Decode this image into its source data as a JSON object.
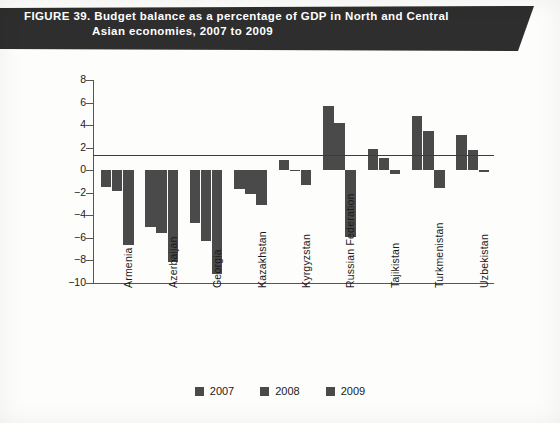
{
  "figure": {
    "banner_line1": "FIGURE 39. Budget balance as a percentage of GDP in North and Central",
    "banner_line2": "Asian economies, 2007 to 2009"
  },
  "legend": {
    "items": [
      {
        "label": "2007",
        "color": "#4a4a4a"
      },
      {
        "label": "2008",
        "color": "#4a4a4a"
      },
      {
        "label": "2009",
        "color": "#4a4a4a"
      }
    ]
  },
  "axis": {
    "y_title": "Percentage of GDP",
    "y_ticks": [
      "8",
      "6",
      "4",
      "2",
      "0",
      "-2",
      "-4",
      "-6",
      "-8",
      "-10"
    ]
  },
  "chart_data": {
    "type": "bar",
    "title": "Budget balance as a percentage of GDP in North and Central Asian economies, 2007 to 2009",
    "xlabel": "",
    "ylabel": "Percentage of GDP",
    "ylim": [
      -10,
      8
    ],
    "ytick_step": 2,
    "grid": false,
    "legend_position": "bottom",
    "categories": [
      "Armenia",
      "Azerbaijan",
      "Georgia",
      "Kazakhstan",
      "Kyrgyzstan",
      "Russian Federation",
      "Tajikistan",
      "Turkmenistan",
      "Uzbekistan"
    ],
    "series": [
      {
        "name": "2007",
        "values": [
          -1.5,
          -5.0,
          -4.7,
          -1.7,
          0.9,
          5.7,
          1.9,
          4.8,
          3.1
        ]
      },
      {
        "name": "2008",
        "values": [
          -1.8,
          -5.6,
          -6.3,
          -2.1,
          -0.1,
          4.2,
          1.1,
          3.5,
          1.8
        ]
      },
      {
        "name": "2009",
        "values": [
          -6.6,
          -8.1,
          -9.2,
          -3.1,
          -1.3,
          -5.9,
          -0.3,
          -1.6,
          -0.2
        ]
      }
    ]
  }
}
